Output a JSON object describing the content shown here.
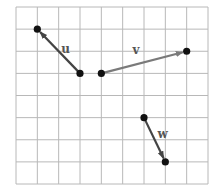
{
  "diagram": {
    "type": "vectors-on-grid",
    "grid": {
      "columns": 9,
      "rows": 8,
      "color": "#b8b8b8"
    },
    "vectors": [
      {
        "name": "u",
        "label": "u",
        "tail": [
          3,
          3
        ],
        "head": [
          1,
          1
        ],
        "color": "#444444"
      },
      {
        "name": "v",
        "label": "v",
        "tail": [
          4,
          3
        ],
        "head": [
          8,
          2
        ],
        "color": "#7a7a7a"
      },
      {
        "name": "w",
        "label": "w",
        "tail": [
          6,
          5
        ],
        "head": [
          7,
          7
        ],
        "color": "#444444"
      }
    ]
  }
}
